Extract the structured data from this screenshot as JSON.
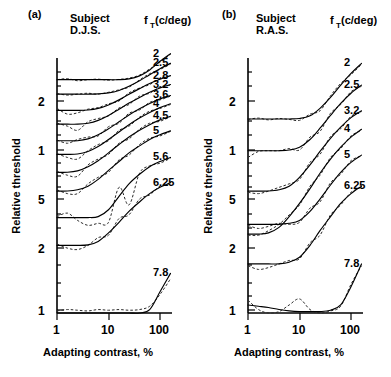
{
  "figure": {
    "background": "#ffffff",
    "foreground": "#000000"
  },
  "panels": [
    {
      "letter": "(a)",
      "subject_word": "Subject",
      "subject_name": "D.J.S.",
      "legend_head": "f",
      "legend_sub": "T",
      "legend_unit": "(c/deg)",
      "xlabel": "Adapting contrast, %",
      "ylabel": "Relative threshold"
    },
    {
      "letter": "(b)",
      "subject_word": "Subject",
      "subject_name": "R.A.S.",
      "legend_head": "f",
      "legend_sub": "T",
      "legend_unit": "(c/deg)",
      "xlabel": "Adapting contrast, %",
      "ylabel": "Relative threshold"
    }
  ],
  "chart_data": [
    {
      "type": "line",
      "title": "Subject D.J.S.",
      "panel": "(a)",
      "xlabel": "Adapting contrast, %",
      "ylabel": "Relative threshold",
      "xscale": "log",
      "yscale": "log",
      "xlim": [
        1,
        200
      ],
      "xticks": [
        1,
        10,
        100
      ],
      "xtick_labels": [
        "1",
        "10",
        "100"
      ],
      "ylim": [
        1,
        40
      ],
      "yticks": [
        20,
        10,
        5,
        2,
        1
      ],
      "ytick_labels": [
        "2",
        "1",
        "5",
        "2",
        "1"
      ],
      "legend_title": "fT(c/deg)",
      "legend_position": "right-of-curves",
      "grid": false,
      "series_note": "each curve is vertically offset; solid = model fit, dashed = data",
      "series": [
        {
          "name": "2",
          "x": [
            1,
            1.6,
            2.5,
            4,
            6.3,
            10,
            16,
            25,
            40,
            63,
            100,
            160
          ],
          "y_solid": [
            27.0,
            27.0,
            27.0,
            27.0,
            27.0,
            27.0,
            27.0,
            27.3,
            28.5,
            31.0,
            35.0,
            39.0
          ],
          "y_dashed": [
            27.0,
            27.4,
            26.6,
            27.0,
            27.2,
            26.8,
            27.1,
            27.6,
            28.8,
            31.4,
            34.5,
            38.6
          ]
        },
        {
          "name": "2.5",
          "x": [
            1,
            1.6,
            2.5,
            4,
            6.3,
            10,
            16,
            25,
            40,
            63,
            100,
            160
          ],
          "y_solid": [
            22.0,
            22.0,
            22.0,
            22.0,
            22.1,
            22.4,
            23.2,
            24.6,
            26.6,
            29.0,
            31.5,
            34.0
          ],
          "y_dashed": [
            22.2,
            21.7,
            22.0,
            22.3,
            22.0,
            22.6,
            23.4,
            24.3,
            26.9,
            29.4,
            31.2,
            33.6
          ]
        },
        {
          "name": "2.8",
          "x": [
            1,
            1.6,
            2.5,
            4,
            6.3,
            10,
            16,
            25,
            40,
            63,
            100,
            160
          ],
          "y_solid": [
            17.5,
            17.5,
            17.5,
            17.6,
            18.0,
            18.9,
            20.3,
            22.0,
            23.8,
            25.6,
            27.2,
            28.6
          ],
          "y_dashed": [
            18.0,
            16.6,
            16.9,
            17.8,
            18.2,
            19.2,
            20.0,
            22.4,
            24.0,
            25.2,
            27.5,
            28.4
          ]
        },
        {
          "name": "3.2",
          "x": [
            1,
            1.6,
            2.5,
            4,
            6.3,
            10,
            16,
            25,
            40,
            63,
            100,
            160
          ],
          "y_solid": [
            14.4,
            14.4,
            14.4,
            14.6,
            15.2,
            16.3,
            17.8,
            19.4,
            21.0,
            22.6,
            24.0,
            25.2
          ],
          "y_dashed": [
            14.6,
            14.0,
            13.2,
            14.9,
            15.6,
            16.2,
            18.1,
            19.0,
            21.4,
            22.3,
            24.4,
            25.0
          ]
        },
        {
          "name": "3.6",
          "x": [
            1,
            1.6,
            2.5,
            4,
            6.3,
            10,
            16,
            25,
            40,
            63,
            100,
            160
          ],
          "y_solid": [
            11.4,
            11.4,
            11.4,
            11.7,
            12.4,
            13.5,
            14.9,
            16.4,
            17.9,
            19.3,
            20.6,
            21.6
          ],
          "y_dashed": [
            11.5,
            11.0,
            11.6,
            12.0,
            12.2,
            13.9,
            14.6,
            16.8,
            17.6,
            19.6,
            20.3,
            21.4
          ]
        },
        {
          "name": "4",
          "x": [
            1,
            1.6,
            2.5,
            4,
            6.3,
            10,
            16,
            25,
            40,
            63,
            100,
            160
          ],
          "y_solid": [
            9.4,
            9.4,
            9.45,
            9.8,
            10.5,
            11.6,
            12.9,
            14.3,
            15.7,
            17.0,
            18.2,
            19.2
          ],
          "y_dashed": [
            9.5,
            9.0,
            8.8,
            9.9,
            10.8,
            11.4,
            13.2,
            14.0,
            15.9,
            17.3,
            18.0,
            19.0
          ]
        },
        {
          "name": "4.5",
          "x": [
            1,
            1.6,
            2.5,
            4,
            6.3,
            10,
            16,
            25,
            40,
            63,
            100,
            160
          ],
          "y_solid": [
            7.3,
            7.3,
            7.45,
            7.9,
            8.6,
            9.6,
            10.8,
            12.0,
            13.2,
            14.3,
            15.3,
            16.1
          ],
          "y_dashed": [
            7.4,
            7.0,
            6.9,
            8.1,
            8.8,
            9.4,
            11.0,
            11.7,
            13.4,
            14.6,
            15.0,
            16.0
          ]
        },
        {
          "name": "5",
          "x": [
            1,
            1.6,
            2.5,
            4,
            6.3,
            10,
            16,
            25,
            40,
            63,
            100,
            160
          ],
          "y_solid": [
            5.6,
            5.6,
            5.7,
            6.0,
            6.6,
            7.5,
            8.5,
            9.6,
            10.6,
            11.6,
            12.4,
            13.1
          ],
          "y_dashed": [
            5.7,
            5.4,
            5.4,
            6.2,
            6.8,
            7.3,
            8.7,
            9.3,
            10.8,
            11.8,
            12.2,
            13.0
          ]
        },
        {
          "name": "5.6",
          "x": [
            1,
            1.6,
            2.5,
            4,
            6.3,
            10,
            16,
            25,
            40,
            63,
            100,
            160
          ],
          "y_solid": [
            3.85,
            3.85,
            3.85,
            3.85,
            3.9,
            4.3,
            5.2,
            6.2,
            7.1,
            7.9,
            8.5,
            9.0
          ],
          "y_dashed": [
            3.9,
            4.1,
            3.7,
            3.45,
            3.55,
            3.6,
            5.9,
            4.6,
            7.2,
            8.0,
            8.3,
            8.9
          ]
        },
        {
          "name": "6.25",
          "x": [
            1,
            1.6,
            2.5,
            4,
            6.3,
            10,
            16,
            25,
            40,
            63,
            100,
            160
          ],
          "y_solid": [
            2.6,
            2.6,
            2.6,
            2.62,
            2.75,
            3.1,
            3.6,
            4.2,
            4.8,
            5.4,
            5.9,
            6.3
          ],
          "y_dashed": [
            2.65,
            2.5,
            2.45,
            2.6,
            2.9,
            3.0,
            3.8,
            4.0,
            5.0,
            5.3,
            6.0,
            6.2
          ]
        },
        {
          "name": "7.8",
          "x": [
            1,
            1.6,
            2.5,
            4,
            6.3,
            10,
            16,
            25,
            40,
            63,
            100,
            160
          ],
          "y_solid": [
            1.0,
            1.0,
            1.0,
            1.0,
            1.0,
            1.0,
            1.0,
            1.0,
            1.0,
            1.05,
            1.35,
            1.75
          ],
          "y_dashed": [
            1.03,
            1.05,
            1.04,
            1.03,
            1.05,
            1.04,
            1.05,
            1.04,
            1.05,
            1.1,
            1.3,
            1.62
          ]
        }
      ]
    },
    {
      "type": "line",
      "title": "Subject R.A.S.",
      "panel": "(b)",
      "xlabel": "Adapting contrast, %",
      "ylabel": "Relative threshold",
      "xscale": "log",
      "yscale": "log",
      "xlim": [
        1,
        200
      ],
      "xticks": [
        1,
        10,
        100
      ],
      "xtick_labels": [
        "1",
        "10",
        "100"
      ],
      "ylim": [
        1,
        40
      ],
      "yticks": [
        20,
        10,
        5,
        2,
        1
      ],
      "ytick_labels": [
        "2",
        "1",
        "5",
        "2",
        "1"
      ],
      "legend_title": "fT(c/deg)",
      "legend_position": "right-of-curves",
      "grid": false,
      "series_note": "each curve is vertically offset; solid = model fit, dashed = data",
      "series": [
        {
          "name": "2",
          "x": [
            1,
            1.6,
            2.5,
            4,
            6.3,
            10,
            16,
            25,
            40,
            63,
            100,
            160
          ],
          "y_solid": [
            15.5,
            15.5,
            15.5,
            15.5,
            15.5,
            15.6,
            16.2,
            18.0,
            21.0,
            25.0,
            29.5,
            34.0
          ],
          "y_dashed": [
            15.4,
            15.7,
            15.3,
            15.6,
            15.4,
            15.2,
            16.6,
            17.4,
            21.5,
            25.6,
            29.0,
            33.5
          ]
        },
        {
          "name": "2.5",
          "x": [
            1,
            1.6,
            2.5,
            4,
            6.3,
            10,
            16,
            25,
            40,
            63,
            100,
            160
          ],
          "y_solid": [
            9.9,
            9.9,
            9.9,
            9.9,
            10.0,
            10.4,
            11.6,
            13.6,
            16.3,
            19.3,
            22.3,
            25.0
          ],
          "y_dashed": [
            9.0,
            9.8,
            9.9,
            9.9,
            10.2,
            10.0,
            12.0,
            13.0,
            16.8,
            19.0,
            22.8,
            24.6
          ]
        },
        {
          "name": "3.2",
          "x": [
            1,
            1.6,
            2.5,
            4,
            6.3,
            10,
            16,
            25,
            40,
            63,
            100,
            160
          ],
          "y_solid": [
            5.6,
            5.6,
            5.6,
            5.7,
            6.0,
            6.8,
            8.1,
            9.8,
            11.8,
            13.8,
            15.8,
            17.4
          ],
          "y_dashed": [
            5.5,
            5.4,
            5.6,
            5.9,
            6.2,
            6.6,
            8.4,
            9.4,
            12.1,
            13.5,
            16.1,
            17.2
          ]
        },
        {
          "name": "4",
          "x": [
            1,
            1.6,
            2.5,
            4,
            6.3,
            10,
            16,
            25,
            40,
            63,
            100,
            160
          ],
          "y_solid": [
            3.05,
            3.05,
            3.1,
            3.35,
            3.9,
            4.7,
            5.8,
            7.2,
            8.8,
            10.4,
            12.0,
            13.4
          ],
          "y_dashed": [
            3.0,
            3.0,
            3.2,
            3.5,
            4.0,
            4.6,
            6.0,
            7.0,
            9.0,
            10.2,
            12.2,
            13.2
          ]
        },
        {
          "name": "5",
          "x": [
            1,
            1.6,
            2.5,
            4,
            6.3,
            10,
            16,
            25,
            40,
            63,
            100,
            160
          ],
          "y_solid": [
            3.5,
            3.5,
            3.5,
            3.5,
            3.55,
            3.7,
            4.2,
            5.0,
            6.1,
            7.3,
            8.4,
            9.3
          ],
          "y_dashed": [
            3.45,
            3.3,
            3.4,
            3.55,
            3.5,
            3.6,
            4.4,
            4.8,
            6.3,
            7.1,
            8.6,
            9.2
          ]
        },
        {
          "name": "6.25",
          "x": [
            1,
            1.6,
            2.5,
            4,
            6.3,
            10,
            16,
            25,
            40,
            63,
            100,
            160
          ],
          "y_solid": [
            2.0,
            2.0,
            2.0,
            2.0,
            2.05,
            2.2,
            2.6,
            3.2,
            3.9,
            4.7,
            5.4,
            6.0
          ],
          "y_dashed": [
            1.95,
            1.85,
            1.9,
            2.0,
            2.1,
            2.15,
            2.7,
            3.0,
            4.0,
            4.6,
            5.5,
            5.9
          ]
        },
        {
          "name": "7.8",
          "x": [
            1,
            1.6,
            2.5,
            4,
            6.3,
            10,
            16,
            25,
            40,
            63,
            100,
            160
          ],
          "y_solid": [
            1.12,
            1.1,
            1.08,
            1.05,
            1.03,
            1.02,
            1.02,
            1.02,
            1.04,
            1.12,
            1.45,
            2.0
          ],
          "y_dashed": [
            1.2,
            1.05,
            1.0,
            1.02,
            1.12,
            1.22,
            1.05,
            1.0,
            1.03,
            1.1,
            1.5,
            1.95
          ]
        }
      ]
    }
  ]
}
